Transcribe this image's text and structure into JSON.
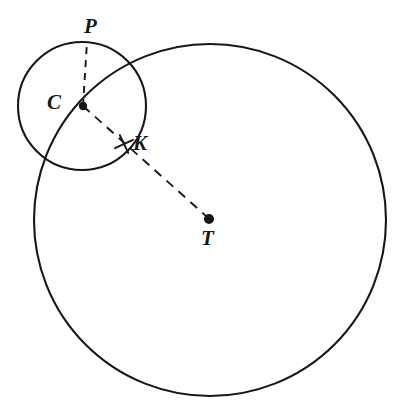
{
  "figure": {
    "background_color": "#ffffff",
    "stroke_color": "#17171a",
    "width": 399,
    "height": 409
  },
  "points": [
    {
      "id": "P",
      "label": "P",
      "label_x": 84,
      "label_y": 16,
      "font_size": 21,
      "dot": false,
      "x": 87,
      "y": 41,
      "description": "point on top of small circle"
    },
    {
      "id": "C",
      "label": "C",
      "label_x": 47,
      "label_y": 92,
      "font_size": 21,
      "dot": true,
      "dot_radius": 4.2,
      "x": 83,
      "y": 106,
      "description": "center of small circle, lies on large circle"
    },
    {
      "id": "K",
      "label": "K",
      "label_x": 133,
      "label_y": 133,
      "font_size": 21,
      "dot": false,
      "x": 124,
      "y": 145,
      "description": "intersection of segment CT with small circle, marked with a cross tick"
    },
    {
      "id": "T",
      "label": "T",
      "label_x": 201,
      "label_y": 228,
      "font_size": 21,
      "dot": true,
      "dot_radius": 5.0,
      "x": 209,
      "y": 219,
      "description": "center of large circle"
    }
  ],
  "circles": [
    {
      "id": "large-circle",
      "name": "large-circle",
      "cx": 210,
      "cy": 220,
      "r": 176,
      "stroke_width": 2.1,
      "style": "solid"
    },
    {
      "id": "small-circle",
      "name": "small-circle",
      "cx": 82,
      "cy": 106,
      "r": 64,
      "stroke_width": 2.1,
      "style": "solid"
    }
  ],
  "segments": [
    {
      "id": "segment-CP",
      "name": "segment-c-to-p",
      "from": "C",
      "to": "P",
      "x1": 83,
      "y1": 106,
      "x2": 87,
      "y2": 42,
      "style": "dashed",
      "dash_pattern": "7 6"
    },
    {
      "id": "segment-CT",
      "name": "segment-c-to-t",
      "from": "C",
      "to": "T",
      "x1": 83,
      "y1": 106,
      "x2": 206,
      "y2": 216,
      "style": "dashed",
      "dash_pattern": "9 7",
      "passes_through": "K"
    }
  ],
  "tick_marks": [
    {
      "id": "tick-K",
      "name": "cross-tick-at-k",
      "cx": 124,
      "cy": 144,
      "size": 7,
      "rotation": 20
    }
  ]
}
